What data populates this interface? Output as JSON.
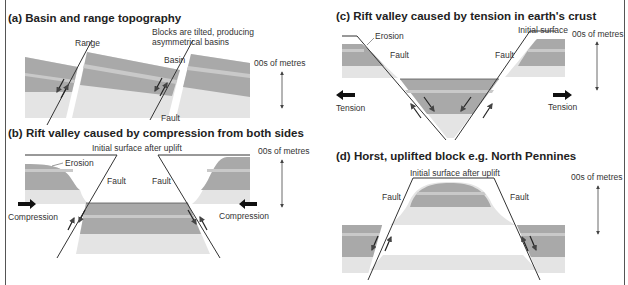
{
  "panels": {
    "a": {
      "title": "(a)  Basin and range topography",
      "labels": {
        "range": "Range",
        "note_line1": "Blocks are tilted, producing",
        "note_line2": "asymmetrical basins",
        "basin": "Basin",
        "fault": "Fault",
        "scale": "00s of metres"
      }
    },
    "b": {
      "title": "(b)  Rift valley caused by compression from both sides",
      "labels": {
        "initial_surface": "Initial surface after uplift",
        "erosion": "Erosion",
        "fault_left": "Fault",
        "fault_right": "Fault",
        "compression_left": "Compression",
        "compression_right": "Compression",
        "scale": "00s of metres"
      }
    },
    "c": {
      "title": "(c)  Rift valley caused by tension in earth's crust",
      "labels": {
        "erosion": "Erosion",
        "initial_surface": "Initial surface",
        "fault_left": "Fault",
        "fault_right": "Fault",
        "tension_left": "Tension",
        "tension_right": "Tension",
        "scale": "00s of metres"
      }
    },
    "d": {
      "title": "(d)  Horst, uplifted block e.g. North Pennines",
      "labels": {
        "initial_surface": "Initial surface after uplift",
        "fault_left": "Fault",
        "fault_right": "Fault",
        "scale": "00s of metres"
      }
    }
  },
  "colors": {
    "layer_dark": "#a9a9a9",
    "layer_stripe": "#c9c9c9",
    "layer_light": "#e4e4e4",
    "line": "#333333"
  }
}
